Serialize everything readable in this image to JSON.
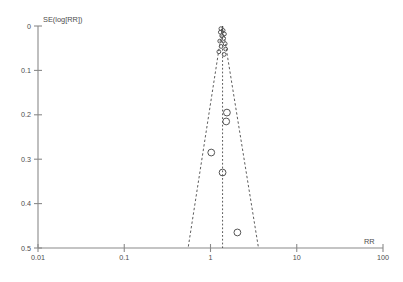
{
  "chart_data": {
    "type": "scatter",
    "title": "",
    "subtitle": "",
    "xlabel": "RR",
    "ylabel": "SE(log[RR])",
    "x_scale": "log",
    "xlim": [
      0.01,
      100
    ],
    "ylim": [
      0,
      0.5
    ],
    "y_inverted": true,
    "grid": false,
    "legend": null,
    "x_ticks": [
      "0.01",
      "0.1",
      "1",
      "10",
      "100"
    ],
    "x_tick_values": [
      0.01,
      0.1,
      1,
      10,
      100
    ],
    "y_ticks": [
      "0",
      "0.1",
      "0.2",
      "0.3",
      "0.4",
      "0.5"
    ],
    "y_tick_values": [
      0,
      0.1,
      0.2,
      0.3,
      0.4,
      0.5
    ],
    "center_rr": 1.38,
    "funnel_lines": {
      "style": "dashed",
      "left_rr_at_bottom": 0.55,
      "right_rr_at_bottom": 3.6,
      "apex_rr": 1.38,
      "apex_se": 0.0
    },
    "series": [
      {
        "name": "Studies",
        "marker": "open-circle",
        "points": [
          {
            "rr": 1.32,
            "se": 0.006
          },
          {
            "rr": 1.4,
            "se": 0.01
          },
          {
            "rr": 1.3,
            "se": 0.014
          },
          {
            "rr": 1.45,
            "se": 0.018
          },
          {
            "rr": 1.35,
            "se": 0.022
          },
          {
            "rr": 1.42,
            "se": 0.028
          },
          {
            "rr": 1.28,
            "se": 0.034
          },
          {
            "rr": 1.48,
            "se": 0.04
          },
          {
            "rr": 1.33,
            "se": 0.046
          },
          {
            "rr": 1.5,
            "se": 0.052
          },
          {
            "rr": 1.25,
            "se": 0.058
          },
          {
            "rr": 1.44,
            "se": 0.064
          },
          {
            "rr": 1.55,
            "se": 0.195
          },
          {
            "rr": 1.52,
            "se": 0.215
          },
          {
            "rr": 1.02,
            "se": 0.285
          },
          {
            "rr": 1.38,
            "se": 0.33
          },
          {
            "rr": 2.05,
            "se": 0.465
          }
        ]
      }
    ],
    "annotations": []
  },
  "axes": {
    "y_axis_title": "SE(log[RR])",
    "x_axis_title": "RR"
  }
}
